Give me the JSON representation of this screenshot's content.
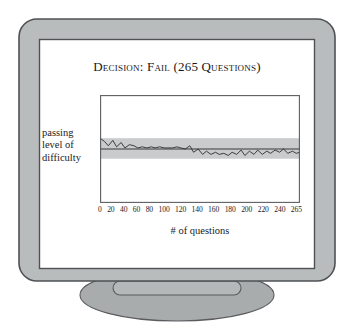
{
  "illustration": {
    "device": "crt-monitor",
    "bezel_color": "#b9bcbd",
    "bezel_outline_color": "#5a5c5f",
    "screen_color": "#ffffff",
    "stand_color": "#a8abac",
    "background_color": "#ffffff"
  },
  "screen": {
    "title": "Decision: Fail (265 Questions)",
    "y_axis_label_lines": [
      "passing",
      "level of",
      "difficulty"
    ],
    "x_axis_title": "# of questions"
  },
  "chart_data": {
    "type": "line",
    "title": "Decision: Fail (265 Questions)",
    "xlabel": "# of questions",
    "ylabel": "passing level of difficulty",
    "grid": false,
    "legend": false,
    "xlim": [
      0,
      265
    ],
    "ylim": [
      0,
      100
    ],
    "tick_labels": [
      "0",
      "20",
      "40",
      "60",
      "80",
      "100",
      "120",
      "140",
      "160",
      "180",
      "200",
      "220",
      "240",
      "265"
    ],
    "tick_values": [
      0,
      20,
      40,
      60,
      80,
      100,
      120,
      140,
      160,
      180,
      200,
      220,
      240,
      265
    ],
    "annotations": [
      {
        "name": "passing-level-line",
        "type": "hline",
        "y": 50,
        "color": "#3b3a3d",
        "label": "passing level of difficulty"
      },
      {
        "name": "confidence-band",
        "type": "hband",
        "y_low": 41,
        "y_high": 60,
        "color": "#c9cbcc"
      }
    ],
    "series": [
      {
        "name": "examinee ability estimate",
        "color": "#2e2d30",
        "x": [
          0,
          6,
          11,
          17,
          22,
          28,
          33,
          39,
          45,
          50,
          56,
          62,
          68,
          73,
          79,
          85,
          90,
          96,
          102,
          107,
          113,
          119,
          124,
          130,
          136,
          141,
          147,
          153,
          158,
          164,
          170,
          175,
          181,
          187,
          192,
          198,
          204,
          209,
          215,
          221,
          226,
          232,
          238,
          243,
          249,
          255,
          260,
          265
        ],
        "y": [
          60,
          57,
          53,
          58,
          52,
          56,
          51,
          54,
          53,
          51,
          52,
          51,
          52,
          51,
          52,
          51,
          51,
          51,
          52,
          51,
          50,
          53,
          47,
          50,
          45,
          48,
          45,
          47,
          45,
          46,
          44,
          47,
          45,
          49,
          44,
          48,
          45,
          49,
          45,
          48,
          46,
          49,
          47,
          50,
          46,
          48,
          46,
          47
        ]
      }
    ]
  }
}
